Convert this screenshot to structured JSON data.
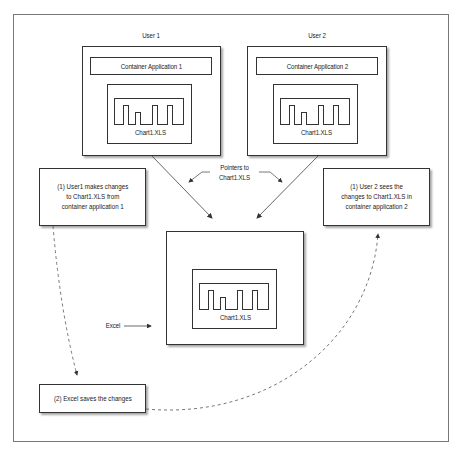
{
  "diagram": {
    "users": [
      {
        "label": "User 1",
        "container_label": "Container Application 1",
        "file_label": "Chart1.XLS"
      },
      {
        "label": "User 2",
        "container_label": "Container Application 2",
        "file_label": "Chart1.XLS"
      }
    ],
    "pointers_label_line1": "Pointers to",
    "pointers_label_line2": "Chart1.XLS",
    "excel": {
      "label": "Excel",
      "file_label": "Chart1.XLS"
    },
    "notes": {
      "left": "(1) User1 makes changes\nto Chart1.XLS from\ncontainer application 1",
      "right": "(1) User 2 sees the\nchanges to Chart1.XLS in\ncontainer application 2",
      "bottom": "(2) Excel saves the changes"
    },
    "chart_bars_relative_heights": [
      1.0,
      0.6,
      1.0,
      1.0
    ]
  }
}
